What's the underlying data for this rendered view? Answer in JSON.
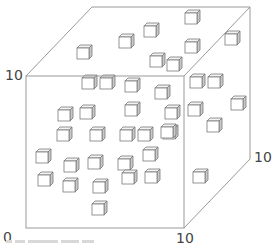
{
  "diagram": {
    "type": "3d-unit-cube-scatter",
    "axis_labels": {
      "origin": "0",
      "x_max": "10",
      "y_max": "10",
      "z_max": "10"
    },
    "colors": {
      "frame_line": "#9a9a9a",
      "cube_face": "#ffffff",
      "cube_side": "#c8c8c8",
      "cube_top": "#f2f2f2",
      "cube_edge": "#7a7a7a",
      "label": "#444444"
    },
    "frame": {
      "front": {
        "left": 26,
        "top": 76,
        "right": 184,
        "bottom": 228
      },
      "depth_offset": {
        "dx": 66,
        "dy": -69
      }
    },
    "cube_size": {
      "w": 12,
      "h": 11,
      "d": 3
    },
    "cubes": [
      {
        "x": 77,
        "y": 48
      },
      {
        "x": 119,
        "y": 37
      },
      {
        "x": 144,
        "y": 26
      },
      {
        "x": 185,
        "y": 13
      },
      {
        "x": 225,
        "y": 34
      },
      {
        "x": 150,
        "y": 56
      },
      {
        "x": 167,
        "y": 60
      },
      {
        "x": 185,
        "y": 42
      },
      {
        "x": 82,
        "y": 78
      },
      {
        "x": 100,
        "y": 78
      },
      {
        "x": 125,
        "y": 81
      },
      {
        "x": 155,
        "y": 88
      },
      {
        "x": 190,
        "y": 77
      },
      {
        "x": 208,
        "y": 77
      },
      {
        "x": 58,
        "y": 110
      },
      {
        "x": 80,
        "y": 108
      },
      {
        "x": 125,
        "y": 105
      },
      {
        "x": 165,
        "y": 108
      },
      {
        "x": 188,
        "y": 105
      },
      {
        "x": 231,
        "y": 99
      },
      {
        "x": 57,
        "y": 130
      },
      {
        "x": 90,
        "y": 130
      },
      {
        "x": 120,
        "y": 130
      },
      {
        "x": 138,
        "y": 130
      },
      {
        "x": 163,
        "y": 128
      },
      {
        "x": 207,
        "y": 121
      },
      {
        "x": 36,
        "y": 152
      },
      {
        "x": 64,
        "y": 161
      },
      {
        "x": 88,
        "y": 158
      },
      {
        "x": 118,
        "y": 159
      },
      {
        "x": 143,
        "y": 150
      },
      {
        "x": 161,
        "y": 127
      },
      {
        "x": 38,
        "y": 175
      },
      {
        "x": 63,
        "y": 181
      },
      {
        "x": 93,
        "y": 182
      },
      {
        "x": 122,
        "y": 173
      },
      {
        "x": 145,
        "y": 172
      },
      {
        "x": 193,
        "y": 172
      },
      {
        "x": 92,
        "y": 204
      }
    ]
  }
}
